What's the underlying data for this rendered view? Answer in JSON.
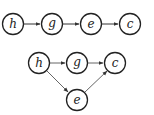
{
  "diagrams": [
    {
      "name": "chain-graph",
      "nodes": [
        {
          "id": "h",
          "label": "h",
          "x": 13,
          "y": 24
        },
        {
          "id": "g",
          "label": "g",
          "x": 52,
          "y": 24
        },
        {
          "id": "e",
          "label": "e",
          "x": 91,
          "y": 24
        },
        {
          "id": "c",
          "label": "c",
          "x": 130,
          "y": 24
        }
      ],
      "edges": [
        {
          "from": "h",
          "to": "g"
        },
        {
          "from": "g",
          "to": "e"
        },
        {
          "from": "e",
          "to": "c"
        }
      ]
    },
    {
      "name": "branch-graph",
      "nodes": [
        {
          "id": "h",
          "label": "h",
          "x": 39,
          "y": 63
        },
        {
          "id": "g",
          "label": "g",
          "x": 77,
          "y": 63
        },
        {
          "id": "c",
          "label": "c",
          "x": 115,
          "y": 63
        },
        {
          "id": "e",
          "label": "e",
          "x": 77,
          "y": 100
        }
      ],
      "edges": [
        {
          "from": "h",
          "to": "g"
        },
        {
          "from": "g",
          "to": "c"
        },
        {
          "from": "h",
          "to": "e"
        },
        {
          "from": "e",
          "to": "c"
        }
      ]
    }
  ],
  "colors": {
    "stroke": "#222222",
    "edge_light": "#666666",
    "background": "#ffffff"
  }
}
